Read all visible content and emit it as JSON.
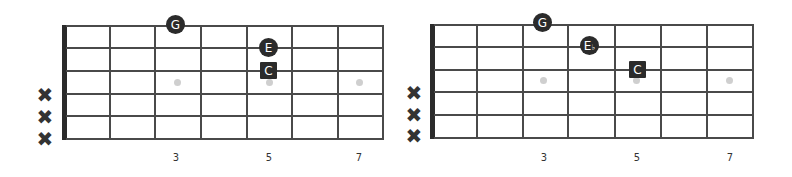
{
  "diagrams": [
    {
      "id": "left",
      "name": "C major shape",
      "muted_strings": [
        "x",
        "x",
        "x"
      ],
      "fret_markers": [
        "3",
        "5",
        "7"
      ],
      "notes": [
        {
          "label": "G",
          "shape": "circle"
        },
        {
          "label": "E",
          "shape": "circle"
        },
        {
          "label": "C",
          "shape": "square"
        }
      ]
    },
    {
      "id": "right",
      "name": "C minor shape",
      "muted_strings": [
        "x",
        "x",
        "x"
      ],
      "fret_markers": [
        "3",
        "5",
        "7"
      ],
      "notes": [
        {
          "label": "G",
          "shape": "circle"
        },
        {
          "label": "E",
          "accidental": "♭",
          "shape": "circle"
        },
        {
          "label": "C",
          "shape": "square"
        }
      ]
    }
  ],
  "colors": {
    "note_fill": "#2b2b2b",
    "note_text": "#ffffff",
    "grid": "#4a4a4a",
    "inlay": "#cfcfcf"
  },
  "mute_symbol": "✖"
}
